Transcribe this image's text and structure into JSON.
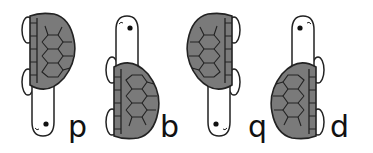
{
  "colors": {
    "shell": "#7a7a7a",
    "outline": "#222222",
    "body": "#ffffff"
  },
  "figures": [
    {
      "letter": "p",
      "orientation": "head-down, shell-right"
    },
    {
      "letter": "b",
      "orientation": "head-up, shell-right"
    },
    {
      "letter": "q",
      "orientation": "head-down, shell-left"
    },
    {
      "letter": "d",
      "orientation": "head-up, shell-left"
    }
  ]
}
